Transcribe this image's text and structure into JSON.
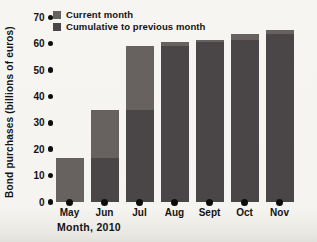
{
  "legend": {
    "items": [
      {
        "label": "Current month",
        "color": "#67625f"
      },
      {
        "label": "Cumulative to previous month",
        "color": "#4a4647"
      }
    ]
  },
  "chart_data": {
    "type": "bar",
    "stacked": true,
    "title": "",
    "xlabel": "Month, 2010",
    "ylabel": "Bond purchases (billions of euros)",
    "categories": [
      "May",
      "Jun",
      "Jul",
      "Aug",
      "Sept",
      "Oct",
      "Nov"
    ],
    "series": [
      {
        "name": "Cumulative to previous month",
        "color": "#4a4647",
        "values": [
          0,
          16.5,
          35,
          59,
          60.5,
          61.5,
          63.5
        ]
      },
      {
        "name": "Current month",
        "color": "#67625f",
        "values": [
          16.5,
          18.5,
          24,
          1.5,
          1,
          2,
          1.5
        ]
      }
    ],
    "cumulative_totals": [
      16.5,
      35,
      59,
      60.5,
      61.5,
      63.5,
      65
    ],
    "ylim": [
      0,
      70
    ],
    "yticks": [
      0,
      10,
      20,
      30,
      40,
      50,
      60,
      70
    ],
    "grid": false,
    "legend_position": "top-left",
    "tick_marker": "filled-dot",
    "bar_base_marker": "filled-dot",
    "text_color": "#131313",
    "background_color": "#f6f4f1"
  }
}
